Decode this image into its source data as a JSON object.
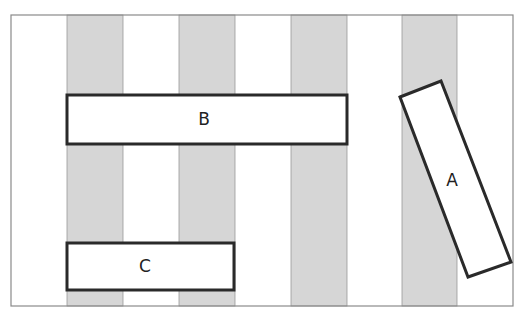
{
  "diagram": {
    "colors": {
      "background": "#ffffff",
      "frame": "#8a8a8a",
      "stripe": "#d6d6d6",
      "stripe_edge": "#9a9a9a",
      "box_fill": "#ffffff",
      "box_stroke": "#2a2a2a"
    },
    "frame": {
      "x": 11,
      "y": 15,
      "w": 502,
      "h": 291
    },
    "stripes": [
      {
        "x": 67,
        "w": 56
      },
      {
        "x": 179,
        "w": 56
      },
      {
        "x": 291,
        "w": 56
      },
      {
        "x": 402,
        "w": 55
      }
    ],
    "boxes": [
      {
        "id": "B",
        "label": "B",
        "points": "67,95 347,95 347,144 67,144",
        "label_x": 204,
        "label_y": 125
      },
      {
        "id": "C",
        "label": "C",
        "points": "67,243 234,243 234,290 67,290",
        "label_x": 145,
        "label_y": 272
      },
      {
        "id": "A",
        "label": "A",
        "points": "400,97 441,81 511,262 468,277",
        "label_x": 452,
        "label_y": 186
      }
    ]
  }
}
